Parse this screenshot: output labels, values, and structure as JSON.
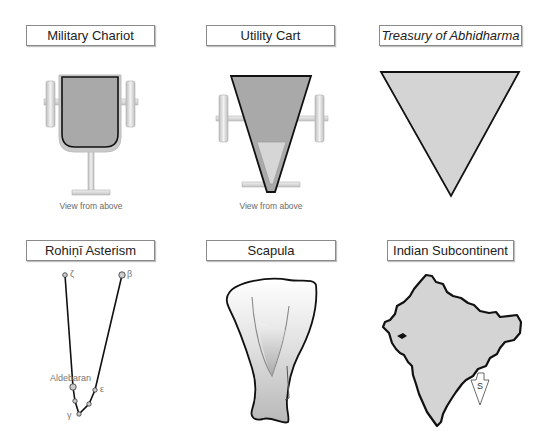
{
  "panels": [
    {
      "id": "military-chariot",
      "title": "Military Chariot",
      "caption": "View from above",
      "italic": false
    },
    {
      "id": "utility-cart",
      "title": "Utility Cart",
      "caption": "View from above",
      "italic": false
    },
    {
      "id": "treasury-of-abhidharma",
      "title": "Treasury of Abhidharma",
      "caption": "",
      "italic": true
    },
    {
      "id": "rohini-asterism",
      "title": "Rohiṇī Asterism",
      "caption": "",
      "italic": false
    },
    {
      "id": "scapula",
      "title": "Scapula",
      "caption": "",
      "italic": false
    },
    {
      "id": "indian-subcontinent",
      "title": "Indian Subcontinent",
      "caption": "",
      "italic": false
    }
  ],
  "asterism": {
    "stars": {
      "zeta": "ζ",
      "beta": "β",
      "aldebaran": "Aldebaran",
      "epsilon": "ε",
      "gamma": "γ"
    }
  },
  "map": {
    "direction_marker": "S"
  },
  "colors": {
    "shape_fill": "#d4d4d4",
    "dark_fill": "#a9a9a9",
    "outline": "#111111",
    "wheel": "#d8d8d8",
    "text": "#222222",
    "caption": "#6a6a6a"
  }
}
